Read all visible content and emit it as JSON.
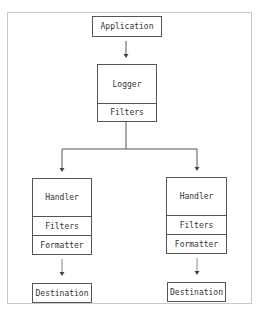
{
  "diagram": {
    "application": {
      "label": "Application"
    },
    "logger": {
      "title": "Logger",
      "sections": [
        "Filters"
      ]
    },
    "handlers": [
      {
        "title": "Handler",
        "sections": [
          "Filters",
          "Formatter"
        ],
        "destination": "Destination"
      },
      {
        "title": "Handler",
        "sections": [
          "Filters",
          "Formatter"
        ],
        "destination": "Destination"
      }
    ],
    "edges": [
      {
        "from": "Application",
        "to": "Logger"
      },
      {
        "from": "Logger",
        "to": "Handler 1"
      },
      {
        "from": "Logger",
        "to": "Handler 2"
      },
      {
        "from": "Handler 1",
        "to": "Destination 1"
      },
      {
        "from": "Handler 2",
        "to": "Destination 2"
      }
    ]
  }
}
